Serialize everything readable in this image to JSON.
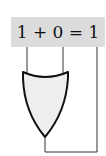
{
  "equation": {
    "text": "1 + 0 = 1",
    "input_a": "1",
    "operator": "+",
    "input_b": "0",
    "equals": "=",
    "output": "1"
  },
  "gate": {
    "type": "OR",
    "fill_color": "#eeeeee",
    "stroke_color": "#111111"
  },
  "colors": {
    "label_background": "#dcdcdc",
    "wire": "#333333"
  }
}
